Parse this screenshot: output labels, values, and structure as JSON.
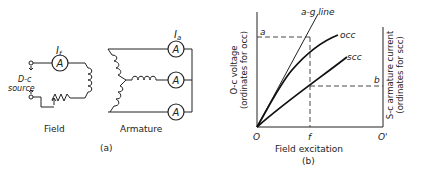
{
  "part_a": {
    "field_current_label": "I",
    "field_current_sub": "f",
    "armature_current_label": "I",
    "armature_current_sub": "a",
    "ammeter_symbol": "A",
    "source_label_line1": "D-c",
    "source_label_line2": "source",
    "field_caption": "Field",
    "armature_caption": "Armature",
    "caption": "(a)"
  },
  "part_b": {
    "curve_ag": "a-g line",
    "curve_occ": "occ",
    "curve_scc": "scc",
    "point_a": "a",
    "point_b": "b",
    "point_f": "f",
    "origin": "O",
    "origin_prime": "O'",
    "xlabel": "Field excitation",
    "ylabel_left_line1": "O-c voltage",
    "ylabel_left_line2": "(ordinates for occ)",
    "ylabel_right_line1": "S-c armature current",
    "ylabel_right_line2": "(ordinates for scc)",
    "caption": "(b)"
  }
}
